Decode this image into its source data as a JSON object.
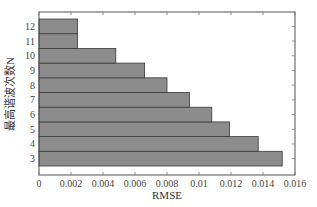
{
  "chart_data": {
    "type": "bar",
    "orientation": "horizontal",
    "title": "",
    "xlabel": "RMSE",
    "ylabel": "最高谐波次数N",
    "categories": [
      "3",
      "4",
      "5",
      "6",
      "7",
      "8",
      "9",
      "10",
      "11",
      "12"
    ],
    "values": [
      0.0152,
      0.0137,
      0.0119,
      0.0108,
      0.0094,
      0.008,
      0.0066,
      0.0048,
      0.0024,
      0.0024
    ],
    "xlim": [
      0,
      0.016
    ],
    "xticks": [
      0,
      0.002,
      0.004,
      0.006,
      0.008,
      0.01,
      0.012,
      0.014,
      0.016
    ],
    "xtick_labels": [
      "0",
      "0.002",
      "0.004",
      "0.006",
      "0.008",
      "0.01",
      "0.012",
      "0.014",
      "0.016"
    ],
    "grid": false,
    "legend": null,
    "bar_color": "#8c8c8c",
    "bar_edge_color": "#3a3a3a"
  }
}
